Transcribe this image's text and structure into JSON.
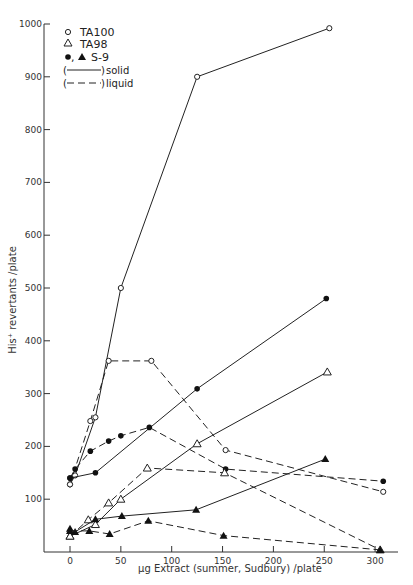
{
  "chart_data": {
    "type": "line",
    "title": "",
    "xlabel": "µg Extract (summer, Sudbury) /plate",
    "ylabel": "His⁺ revertants /plate",
    "xlim": [
      -25,
      320
    ],
    "ylim": [
      0,
      1000
    ],
    "x_ticks": [
      0,
      50,
      100,
      150,
      200,
      250,
      300
    ],
    "y_ticks": [
      100,
      200,
      300,
      400,
      500,
      600,
      700,
      800,
      900,
      1000
    ],
    "grid": false,
    "legend_position": "upper left",
    "legend": [
      {
        "symbol": "open-circle",
        "label": "TA100"
      },
      {
        "symbol": "open-triangle",
        "label": "TA98"
      },
      {
        "symbol": "filled-circle-triangle",
        "label": "S-9"
      },
      {
        "symbol": "solid-line",
        "label": "solid"
      },
      {
        "symbol": "dashed-line",
        "label": "liquid"
      }
    ],
    "series": [
      {
        "name": "TA100 solid",
        "marker": "open-circle",
        "line": "solid",
        "x": [
          0,
          5,
          25,
          50,
          125,
          255
        ],
        "y": [
          128,
          145,
          255,
          500,
          900,
          992
        ]
      },
      {
        "name": "TA100 liquid",
        "marker": "open-circle",
        "line": "dashed",
        "x": [
          0,
          20,
          38,
          80,
          153,
          308
        ],
        "y": [
          128,
          248,
          362,
          362,
          193,
          114
        ]
      },
      {
        "name": "TA100 + S-9 solid",
        "marker": "filled-circle",
        "line": "solid",
        "x": [
          0,
          25,
          125,
          252
        ],
        "y": [
          140,
          150,
          309,
          480
        ]
      },
      {
        "name": "TA100 + S-9 liquid",
        "marker": "filled-circle",
        "line": "dashed",
        "x": [
          0,
          5,
          20,
          38,
          50,
          78,
          153,
          308
        ],
        "y": [
          140,
          157,
          191,
          210,
          220,
          236,
          157,
          134
        ]
      },
      {
        "name": "TA98 solid",
        "marker": "open-triangle",
        "line": "solid",
        "x": [
          0,
          25,
          50,
          125,
          253
        ],
        "y": [
          30,
          52,
          100,
          205,
          341
        ]
      },
      {
        "name": "TA98 liquid",
        "marker": "open-triangle",
        "line": "dashed",
        "x": [
          0,
          18,
          38,
          76,
          152,
          305
        ],
        "y": [
          30,
          61,
          93,
          159,
          150,
          4
        ]
      },
      {
        "name": "TA98 + S-9 solid",
        "marker": "filled-triangle",
        "line": "solid",
        "x": [
          0,
          5,
          25,
          51,
          124,
          251
        ],
        "y": [
          44,
          38,
          62,
          68,
          80,
          176
        ]
      },
      {
        "name": "TA98 + S-9 liquid",
        "marker": "filled-triangle",
        "line": "dashed",
        "x": [
          0,
          19,
          39,
          77,
          151,
          305
        ],
        "y": [
          40,
          40,
          34,
          59,
          31,
          4
        ]
      }
    ]
  },
  "legend_text": {
    "ta100": "TA100",
    "ta98": "TA98",
    "s9": "S-9",
    "solid": "solid",
    "liquid": "liquid"
  },
  "axes_text": {
    "xlabel": "µg Extract (summer, Sudbury) /plate",
    "ylabel": "His⁺ revertants /plate"
  }
}
